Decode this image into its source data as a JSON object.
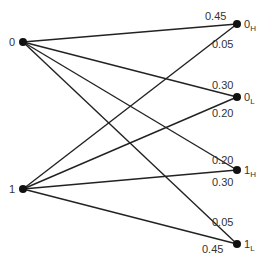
{
  "diagram": {
    "title": "",
    "left_nodes": [
      {
        "id": "0",
        "label": "0"
      },
      {
        "id": "1",
        "label": "1"
      }
    ],
    "right_nodes": [
      {
        "id": "0H",
        "label": "0",
        "subscript": "H"
      },
      {
        "id": "0L",
        "label": "0",
        "subscript": "L"
      },
      {
        "id": "1H",
        "label": "1",
        "subscript": "H"
      },
      {
        "id": "1L",
        "label": "1",
        "subscript": "L"
      }
    ],
    "edges": [
      {
        "from": "0",
        "to": "0H",
        "prob": "0.45"
      },
      {
        "from": "0",
        "to": "0L",
        "prob": "0.30"
      },
      {
        "from": "0",
        "to": "1H",
        "prob": "0.20"
      },
      {
        "from": "0",
        "to": "1L",
        "prob": "0.05"
      },
      {
        "from": "1",
        "to": "0H",
        "prob": "0.05"
      },
      {
        "from": "1",
        "to": "0L",
        "prob": "0.20"
      },
      {
        "from": "1",
        "to": "1H",
        "prob": "0.30"
      },
      {
        "from": "1",
        "to": "1L",
        "prob": "0.45"
      }
    ],
    "colors": {
      "line": "#222222",
      "node": "#111111",
      "text": "#333333"
    }
  }
}
